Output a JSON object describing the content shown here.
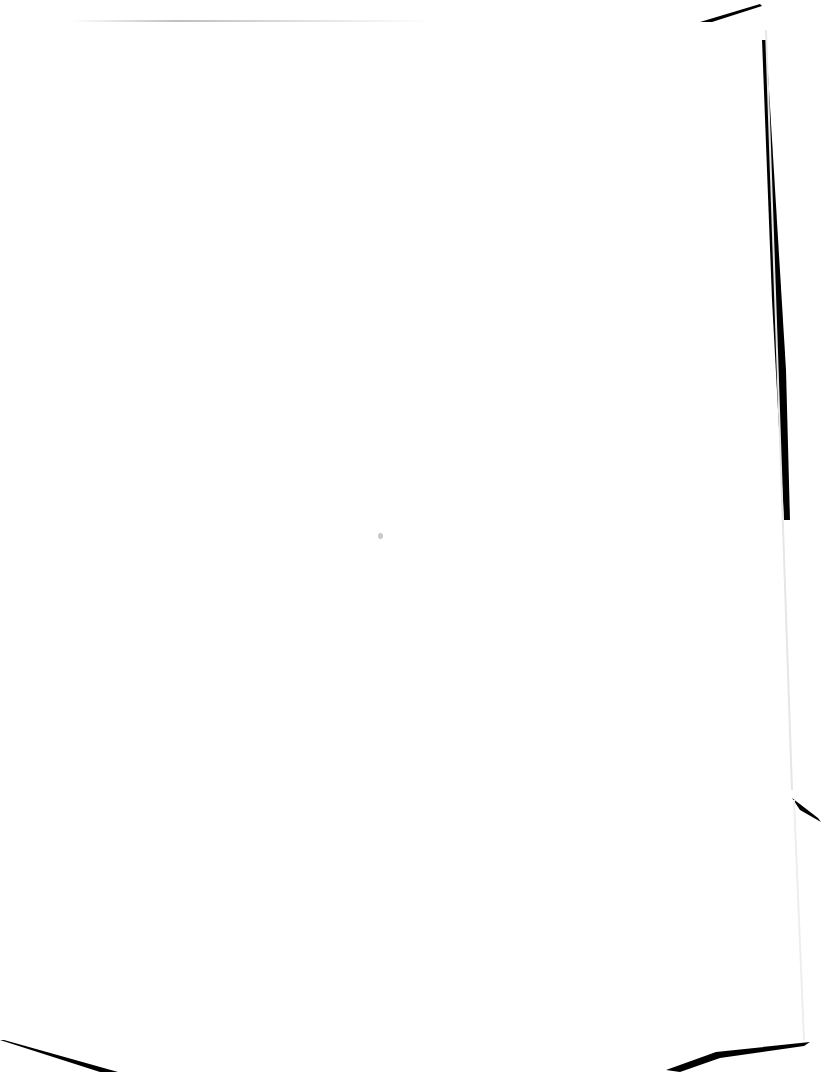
{
  "document": {
    "type": "blank scanned page",
    "text": "",
    "colors": {
      "paper": "#ffffff",
      "scan_edge": "#000000",
      "speck": "#c8c8c8"
    }
  }
}
